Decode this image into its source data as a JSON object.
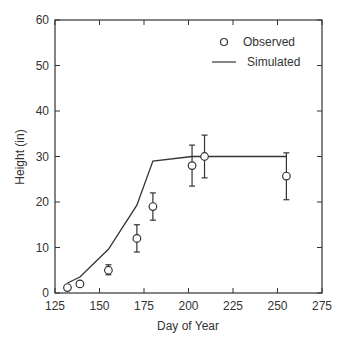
{
  "chart_data": {
    "type": "scatter",
    "title": "",
    "xlabel": "Day of Year",
    "ylabel": "Height (in)",
    "xlim": [
      125,
      275
    ],
    "ylim": [
      0,
      60
    ],
    "xticks": [
      125,
      150,
      175,
      200,
      225,
      250,
      275
    ],
    "yticks": [
      0,
      10,
      20,
      30,
      40,
      50,
      60
    ],
    "grid": false,
    "legend_position": "upper right",
    "series": [
      {
        "name": "Observed",
        "type": "scatter",
        "marker": "open-circle",
        "x": [
          132,
          139,
          155,
          171,
          180,
          202,
          209,
          255
        ],
        "y": [
          1.2,
          2.0,
          5.0,
          12.0,
          19.0,
          28.0,
          30.0,
          25.7
        ],
        "error_low": [
          null,
          null,
          4.0,
          9.0,
          16.0,
          23.5,
          25.3,
          20.5
        ],
        "error_high": [
          null,
          null,
          6.2,
          15.0,
          22.0,
          32.5,
          34.7,
          30.8
        ]
      },
      {
        "name": "Simulated",
        "type": "line",
        "x": [
          132,
          139,
          155,
          171,
          180,
          202,
          255
        ],
        "y": [
          2.2,
          3.5,
          9.6,
          19.3,
          29.0,
          30.0,
          30.0
        ]
      }
    ]
  },
  "colors": {
    "axis": "#333333",
    "line": "#333333",
    "marker": "#333333",
    "background": "#ffffff"
  }
}
